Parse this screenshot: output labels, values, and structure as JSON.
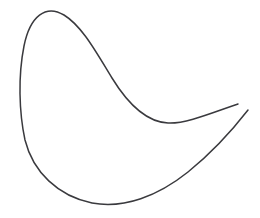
{
  "canvas": {
    "width": 260,
    "height": 218,
    "background_color": "#ffffff",
    "subject": "hand-drawn crescent outline",
    "medium": "pen line drawing"
  },
  "ink": {
    "stroke_color": "#3a3a3e",
    "stroke_width": 1.5,
    "stroke_linecap": "round",
    "fill": "none"
  },
  "strokes": [
    {
      "name": "outer-crescent-stroke",
      "description": "Long outer contour: starts at upper-right tip, rises left over the top apex, sweeps down the left flank, rounds the bottom, and sweeps out to the lower-right tip",
      "start_point": [
        238,
        104
      ],
      "end_point": [
        248,
        110
      ],
      "path": "M 238 104 C 214 112, 186 124, 168 123 C 146 122, 128 104, 112 78 C 96 52, 82 26, 64 15 C 46 4, 30 16, 24 46 C 18 76, 19 112, 25 140 C 33 172, 58 196, 92 203 C 124 209, 158 196, 188 172 C 214 151, 234 128, 248 110"
    }
  ],
  "key_points": {
    "top_apex": [
      55,
      13
    ],
    "left_extreme": [
      20,
      92
    ],
    "bottom_extreme": [
      120,
      204
    ],
    "inner_valley": [
      168,
      123
    ],
    "upper_right_tip": [
      238,
      104
    ],
    "lower_right_tip": [
      248,
      110
    ]
  }
}
